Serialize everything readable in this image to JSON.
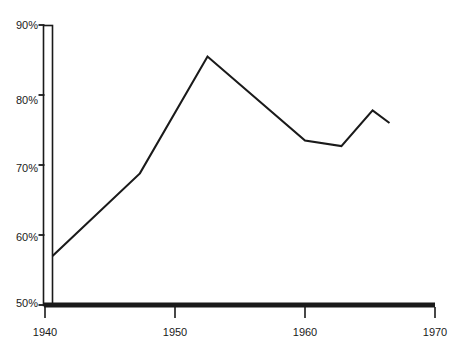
{
  "chart_data": {
    "type": "line",
    "title": "",
    "subtitle": "",
    "xlabel": "",
    "ylabel": "",
    "xlim": [
      1940,
      1970
    ],
    "ylim": [
      50,
      90
    ],
    "grid": false,
    "legend": null,
    "axis_style": {
      "y_axis": "double-rule-bar",
      "x_axis": "thick-rule",
      "line_color": "#1a1a1a",
      "series_color": "#1a1a1a"
    },
    "x_ticks": [
      1940,
      1950,
      1960,
      1970
    ],
    "x_tick_labels": [
      "1940",
      "1950",
      "1960",
      "1970"
    ],
    "y_ticks": [
      50,
      60,
      70,
      80,
      90
    ],
    "y_tick_labels": [
      "50%",
      "60%",
      "70%",
      "80%",
      "90%"
    ],
    "series": [
      {
        "name": "series-1",
        "x": [
          1940.0,
          1947.3,
          1952.5,
          1960.0,
          1962.8,
          1965.2,
          1966.5
        ],
        "values": [
          57.0,
          68.8,
          85.5,
          73.5,
          72.7,
          77.8,
          76.0
        ]
      }
    ]
  },
  "colors": {
    "background": "#ffffff",
    "ink": "#1a1a1a",
    "series": "#1a1a1a"
  }
}
